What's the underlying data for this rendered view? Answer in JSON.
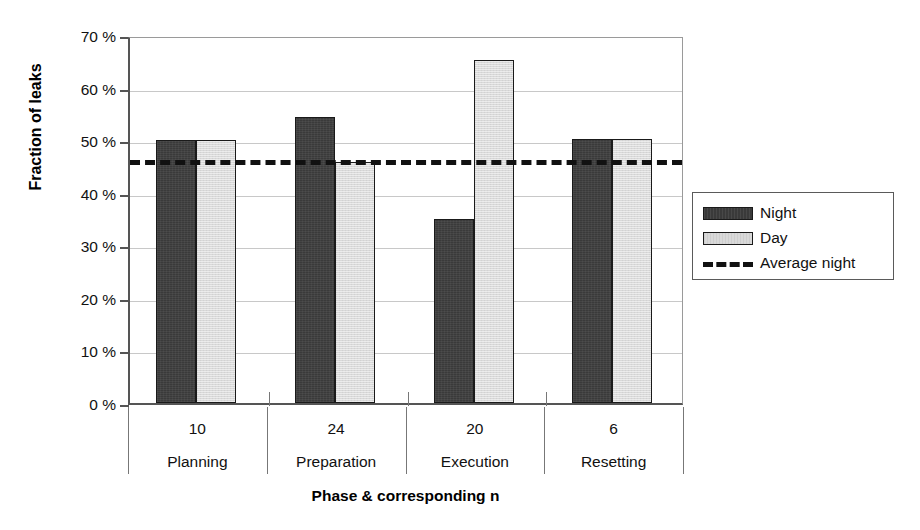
{
  "chart_data": {
    "type": "bar",
    "title": "",
    "xlabel": "Phase & corresponding n",
    "ylabel": "Fraction of leaks",
    "categories": [
      "Planning",
      "Preparation",
      "Execution",
      "Resetting"
    ],
    "category_n": [
      "10",
      "24",
      "20",
      "6"
    ],
    "ylim": [
      0,
      70
    ],
    "ytick_values": [
      0,
      10,
      20,
      30,
      40,
      50,
      60,
      70
    ],
    "ytick_labels": [
      "0 %",
      "10 %",
      "20 %",
      "30 %",
      "40 %",
      "50 %",
      "60 %",
      "70 %"
    ],
    "grid": true,
    "legend_position": "right",
    "series": [
      {
        "name": "Night",
        "kind": "bar",
        "color": "#3a3a3a",
        "values": [
          50.0,
          54.4,
          35.0,
          50.3
        ]
      },
      {
        "name": "Day",
        "kind": "bar",
        "color": "#d9d9d9",
        "values": [
          50.0,
          45.9,
          65.2,
          50.3
        ]
      },
      {
        "name": "Average night",
        "kind": "line",
        "style": "dashed",
        "color": "#111111",
        "value": 46.8
      }
    ]
  },
  "legend": {
    "items": [
      {
        "label": "Night",
        "swatch": "dark-bar-swatch"
      },
      {
        "label": "Day",
        "swatch": "light-bar-swatch"
      },
      {
        "label": "Average night",
        "swatch": "dashed-line-swatch"
      }
    ]
  },
  "axes": {
    "y_title": "Fraction of leaks",
    "x_title": "Phase & corresponding n"
  }
}
